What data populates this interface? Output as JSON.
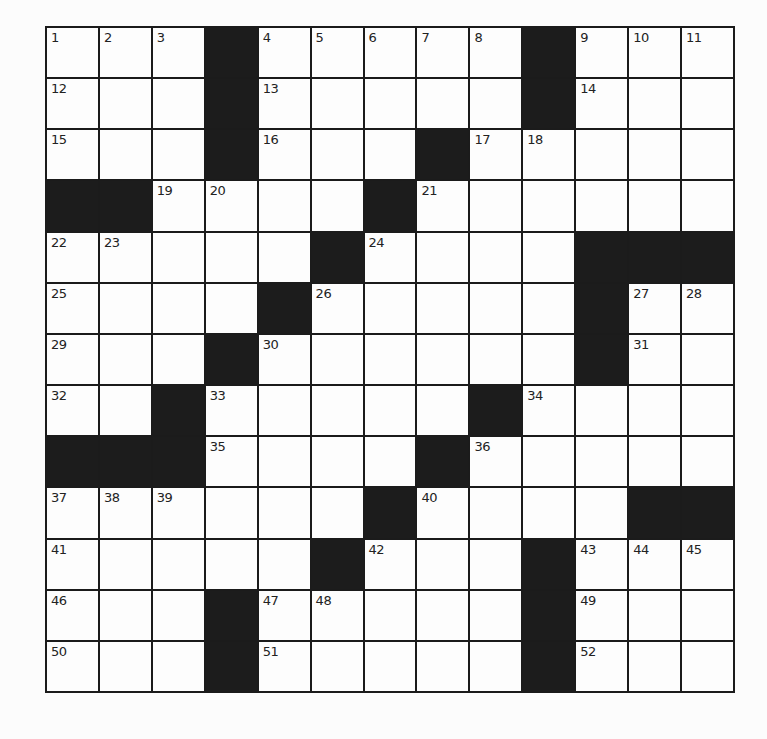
{
  "puzzle": {
    "type": "crossword",
    "rows": 13,
    "cols": 13,
    "layout": [
      "...#.....#...",
      "...#.....#...",
      "...#...#.....",
      "##....#......",
      ".....#....###",
      "....#.....#..",
      "...#......#..",
      "..#.....#....",
      "###....#.....",
      "......#....##",
      ".....#...#...",
      "...#.....#...",
      "...#.....#..."
    ],
    "numbers": [
      [
        1,
        2,
        3,
        0,
        4,
        5,
        6,
        7,
        8,
        0,
        9,
        10,
        11
      ],
      [
        12,
        0,
        0,
        0,
        13,
        0,
        0,
        0,
        0,
        0,
        14,
        0,
        0
      ],
      [
        15,
        0,
        0,
        0,
        16,
        0,
        0,
        0,
        17,
        18,
        0,
        0,
        0
      ],
      [
        0,
        0,
        19,
        20,
        0,
        0,
        0,
        21,
        0,
        0,
        0,
        0,
        0
      ],
      [
        22,
        23,
        0,
        0,
        0,
        0,
        24,
        0,
        0,
        0,
        0,
        0,
        0
      ],
      [
        25,
        0,
        0,
        0,
        0,
        26,
        0,
        0,
        0,
        0,
        0,
        27,
        28
      ],
      [
        29,
        0,
        0,
        0,
        30,
        0,
        0,
        0,
        0,
        0,
        0,
        31,
        0
      ],
      [
        32,
        0,
        0,
        33,
        0,
        0,
        0,
        0,
        0,
        34,
        0,
        0,
        0
      ],
      [
        0,
        0,
        0,
        35,
        0,
        0,
        0,
        0,
        36,
        0,
        0,
        0,
        0
      ],
      [
        37,
        38,
        39,
        0,
        0,
        0,
        0,
        40,
        0,
        0,
        0,
        0,
        0
      ],
      [
        41,
        0,
        0,
        0,
        0,
        0,
        42,
        0,
        0,
        0,
        43,
        44,
        45
      ],
      [
        46,
        0,
        0,
        0,
        47,
        48,
        0,
        0,
        0,
        0,
        49,
        0,
        0
      ],
      [
        50,
        0,
        0,
        0,
        51,
        0,
        0,
        0,
        0,
        0,
        52,
        0,
        0
      ]
    ],
    "letters": [],
    "colors": {
      "black_cell": "#1c1c1c",
      "white_cell": "#fdfdfd",
      "grid_line": "#1b1b1b",
      "number_text": "#222222"
    }
  }
}
